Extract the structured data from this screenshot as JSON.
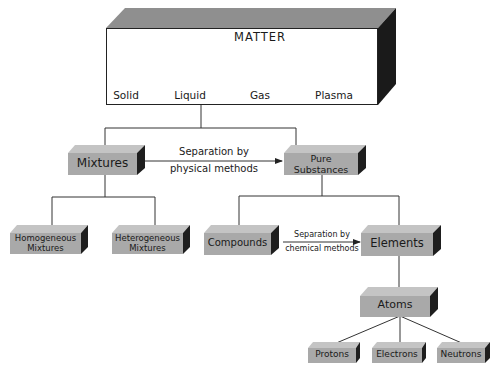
{
  "title": "MATTER",
  "states": [
    {
      "label": "Solid",
      "icon": "solid-cube-icon"
    },
    {
      "label": "Liquid",
      "icon": "liquid-drop-icon"
    },
    {
      "label": "Gas",
      "icon": "gas-cloud-icon"
    },
    {
      "label": "Plasma",
      "icon": "plasma-sphere-icon"
    }
  ],
  "nodes": {
    "mixtures": "Mixtures",
    "pure_substances_line1": "Pure",
    "pure_substances_line2": "Substances",
    "homogeneous_line1": "Homogeneous",
    "homogeneous_line2": "Mixtures",
    "heterogeneous_line1": "Heterogeneous",
    "heterogeneous_line2": "Mixtures",
    "compounds": "Compounds",
    "elements": "Elements",
    "atoms": "Atoms",
    "protons": "Protons",
    "electrons": "Electrons",
    "neutrons": "Neutrons"
  },
  "edges": {
    "physical_line1": "Separation by",
    "physical_line2": "physical methods",
    "chemical_line1": "Separation by",
    "chemical_line2": "chemical methods"
  },
  "colors": {
    "box_front": "#a9a9a9",
    "box_top": "#c4c4c4",
    "box_side": "#1e1e1e",
    "line": "#333333"
  }
}
